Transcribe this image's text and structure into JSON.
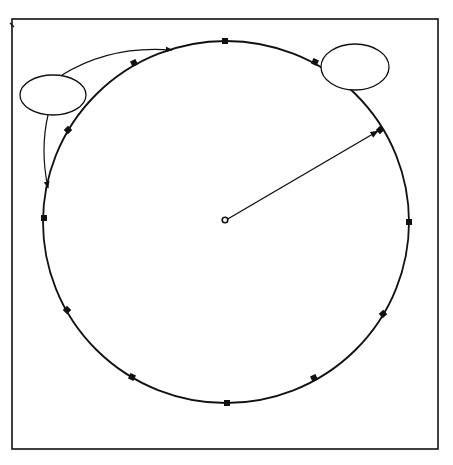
{
  "diagram": {
    "frame": {
      "x": 12,
      "y": 19,
      "w": 426,
      "h": 430
    },
    "circle": {
      "cx": 226,
      "cy": 222,
      "rx": 183,
      "ry": 181
    },
    "center_point": {
      "label": "a",
      "x": 224,
      "y": 220
    },
    "radius": {
      "length_label": "8'0\"",
      "name_label": "Radius",
      "end": {
        "x": 380,
        "y": 130
      }
    },
    "callouts": [
      {
        "id": "plywood-form",
        "lines": [
          "Plywood",
          "Form"
        ],
        "cx": 53,
        "cy": 95,
        "rx": 33,
        "ry": 20
      },
      {
        "id": "supporting-stakes",
        "lines": [
          "Supporting",
          "Stakes"
        ],
        "cx": 355,
        "cy": 67,
        "rx": 33,
        "ry": 23
      }
    ],
    "stakes": [
      {
        "x": 225,
        "y": 41
      },
      {
        "x": 315,
        "y": 62
      },
      {
        "x": 380,
        "y": 130
      },
      {
        "x": 409,
        "y": 222
      },
      {
        "x": 383,
        "y": 314
      },
      {
        "x": 314,
        "y": 378
      },
      {
        "x": 227,
        "y": 403
      },
      {
        "x": 132,
        "y": 377
      },
      {
        "x": 67,
        "y": 310
      },
      {
        "x": 44,
        "y": 218
      },
      {
        "x": 68,
        "y": 130
      },
      {
        "x": 134,
        "y": 63
      }
    ],
    "formula": {
      "line1_prefix": "Area = π x r",
      "line1_sup": "2",
      "line2": "Area = 3.1416 x 8' x 8'",
      "line3": "Area = 201.06 sq. ft."
    },
    "legend": {
      "title": "LEGEND",
      "pi_def": "π = 3.1416",
      "r_def": "r = Radius (½ of diameter)"
    },
    "colors": {
      "ink": "#111111",
      "paper": "#ffffff"
    }
  }
}
